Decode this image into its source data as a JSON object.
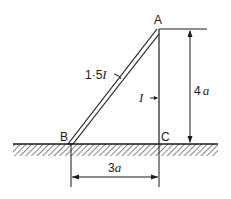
{
  "diagram": {
    "type": "structural-frame",
    "points": {
      "A": {
        "label": "A"
      },
      "B": {
        "label": "B"
      },
      "C": {
        "label": "C"
      }
    },
    "members": {
      "AB": {
        "label_prefix": "1·5",
        "label_symbol": "I",
        "style": "double-line"
      },
      "AC": {
        "label_symbol": "I",
        "style": "single-line"
      }
    },
    "dimensions": {
      "vertical": {
        "label_num": "4",
        "label_var": "a"
      },
      "horizontal": {
        "label_num": "3",
        "label_var": "a"
      }
    },
    "ground": {
      "style": "hatched"
    }
  }
}
